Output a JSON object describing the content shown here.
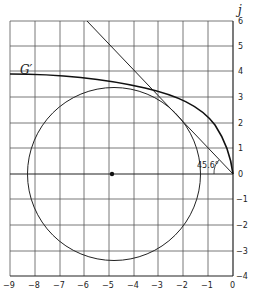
{
  "diagram": {
    "axis_label_y": "j",
    "curve_label": "G′",
    "angle_annotation": "45.6°",
    "x_ticks": [
      "−9",
      "−8",
      "−7",
      "−6",
      "−5",
      "−4",
      "−3",
      "−2",
      "−1",
      "0"
    ],
    "y_ticks": [
      "6",
      "5",
      "4",
      "3",
      "2",
      "1",
      "0",
      "−1",
      "−2",
      "−3",
      "−4"
    ],
    "circle": {
      "center": [
        -4.8,
        0
      ],
      "radius": 3.5
    },
    "tangent_line": {
      "from": [
        0,
        0
      ],
      "to": [
        -5.9,
        6
      ],
      "angle_deg": 45.6
    },
    "colors": {
      "ink": "#222222",
      "grid": "#555555",
      "background": "#ffffff"
    }
  }
}
